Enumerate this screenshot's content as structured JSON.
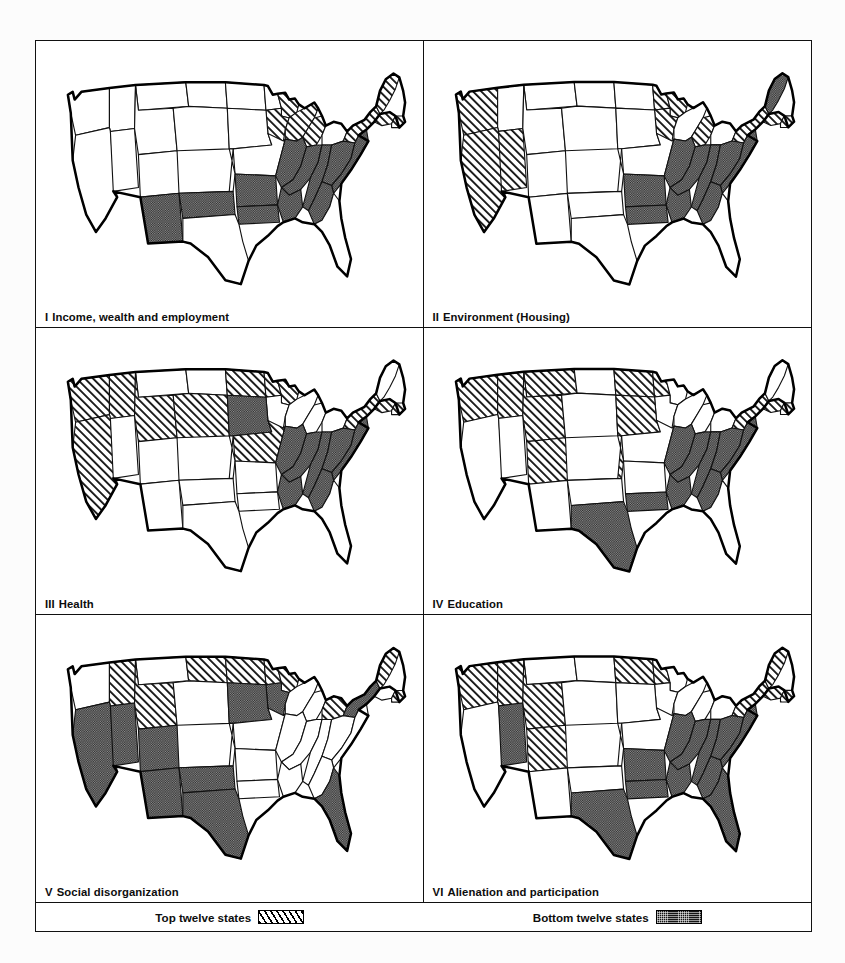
{
  "figure": {
    "type": "map-panel-grid",
    "panels": [
      {
        "num": "I",
        "title": "Income, wealth and employment",
        "top_twelve": [
          "CA",
          "NV",
          "MI",
          "WI",
          "IL",
          "MN",
          "ME",
          "NH",
          "VT",
          "MA",
          "CT",
          "RI"
        ],
        "bottom_twelve": [
          "NM",
          "TX",
          "OK",
          "AR",
          "LA",
          "MS",
          "AL",
          "GA",
          "SC",
          "TN",
          "KY",
          "WV",
          "NC",
          "VA"
        ]
      },
      {
        "num": "II",
        "title": "Environment (Housing)",
        "top_twelve": [
          "WA",
          "CA",
          "NV",
          "OR",
          "WI",
          "MI",
          "IL",
          "IN",
          "OH",
          "NJ",
          "CT",
          "RI",
          "NH"
        ],
        "bottom_twelve": [
          "TX",
          "OK",
          "AR",
          "LA",
          "MS",
          "AL",
          "GA",
          "SC",
          "NC",
          "TN",
          "KY",
          "WV",
          "VA",
          "ME"
        ]
      },
      {
        "num": "III",
        "title": "Health",
        "top_twelve": [
          "WA",
          "OR",
          "CA",
          "ID",
          "UT",
          "CO",
          "WY",
          "NE",
          "MN",
          "MA",
          "CT",
          "RI",
          "HI"
        ],
        "bottom_twelve": [
          "SD",
          "AR",
          "LA",
          "MS",
          "AL",
          "GA",
          "SC",
          "NC",
          "TN",
          "KY",
          "WV",
          "VA"
        ]
      },
      {
        "num": "IV",
        "title": "Education",
        "top_twelve": [
          "WA",
          "OR",
          "ID",
          "MT",
          "UT",
          "WY",
          "CO",
          "KS",
          "NE",
          "MN",
          "VT",
          "NH",
          "MA",
          "CT",
          "RI"
        ],
        "bottom_twelve": [
          "TX",
          "LA",
          "AR",
          "MS",
          "AL",
          "GA",
          "SC",
          "NC",
          "TN",
          "KY",
          "WV",
          "VA",
          "MD",
          "DE"
        ]
      },
      {
        "num": "V",
        "title": "Social disorganization",
        "top_twelve": [
          "ID",
          "UT",
          "MT",
          "ND",
          "SD",
          "MN",
          "WI",
          "VT",
          "NH",
          "MD",
          "DE",
          "PA"
        ],
        "bottom_twelve": [
          "CA",
          "NV",
          "OR",
          "AZ",
          "NM",
          "CO",
          "TX",
          "IA",
          "NY",
          "FL",
          "MI"
        ]
      },
      {
        "num": "VI",
        "title": "Alienation and participation",
        "top_twelve": [
          "WA",
          "OR",
          "ID",
          "MT",
          "UT",
          "WY",
          "MN",
          "VT",
          "NH",
          "MA",
          "ME",
          "RI"
        ],
        "bottom_twelve": [
          "NV",
          "TX",
          "OK",
          "AR",
          "LA",
          "MS",
          "AL",
          "GA",
          "SC",
          "NC",
          "TN",
          "KY",
          "WV",
          "VA",
          "MD",
          "FL"
        ]
      }
    ],
    "legend": {
      "top_label": "Top twelve  states",
      "bottom_label": "Bottom twelve states",
      "top_pattern": "diagonal-hatch",
      "bottom_pattern": "dark-stipple",
      "top_color": "#ffffff",
      "bottom_color": "#141414"
    }
  }
}
